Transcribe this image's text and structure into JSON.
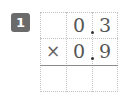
{
  "problem": {
    "number": "1",
    "badge_color": "#6b6b6b",
    "multiplicand": {
      "ones": "0",
      "tenths": "3",
      "display": "0.3"
    },
    "multiplier": {
      "ones": "0",
      "tenths": "9",
      "display": "0.9"
    },
    "operator": "×",
    "answer": {
      "cells": [
        "",
        "",
        ""
      ]
    }
  }
}
